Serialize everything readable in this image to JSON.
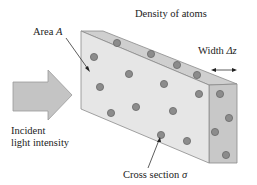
{
  "diagram": {
    "title_label": "Density of atoms",
    "area_label": "Area",
    "area_symbol": "A",
    "width_label": "Width",
    "width_symbol": "Δz",
    "incident_label_line1": "Incident",
    "incident_label_line2": "light intensity",
    "cross_section_label": "Cross section",
    "cross_section_symbol": "σ",
    "colors": {
      "front_face": "#e6e6e6",
      "top_face": "#cfcfcf",
      "side_face": "#c8c8c8",
      "edge": "#8a8a8a",
      "arrow_fill": "#c4c4c4",
      "atom_fill": "#8c8c8c",
      "atom_stroke": "#6a6a6a",
      "text": "#222222"
    },
    "atoms": {
      "top": [
        [
          117,
          43
        ],
        [
          151,
          54
        ],
        [
          177,
          65
        ],
        [
          197,
          75
        ]
      ],
      "front": [
        [
          94,
          57
        ],
        [
          129,
          74
        ],
        [
          100,
          87
        ],
        [
          164,
          84
        ],
        [
          199,
          94
        ],
        [
          111,
          113
        ],
        [
          136,
          107
        ],
        [
          173,
          111
        ],
        [
          161,
          135
        ],
        [
          187,
          141
        ]
      ],
      "side": [
        [
          220,
          94
        ],
        [
          229,
          118
        ],
        [
          215,
          132
        ],
        [
          226,
          155
        ]
      ]
    }
  }
}
